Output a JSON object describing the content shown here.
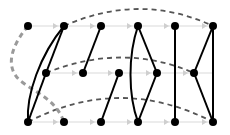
{
  "diagram": {
    "type": "graph",
    "colors": {
      "background": "#ffffff",
      "node": "#000000",
      "solid_edge": "#000000",
      "dashed_edge": "#555555",
      "gray_dashed_edge": "#9a9a9a",
      "guide_line": "#e6e6e6",
      "guide_arrow": "#cfcfcf"
    },
    "rows": [
      {
        "name": "row-top",
        "y": 26,
        "nodes": [
          28,
          64,
          101,
          138,
          175,
          213
        ]
      },
      {
        "name": "row-middle",
        "y": 73,
        "nodes": [
          46,
          83,
          119,
          157,
          194
        ]
      },
      {
        "name": "row-bottom",
        "y": 122,
        "nodes": [
          28,
          64,
          101,
          138,
          175,
          213
        ]
      }
    ],
    "solid_edges": [
      {
        "from": [
          64,
          26
        ],
        "to": [
          28,
          122
        ],
        "curve": true
      },
      {
        "from": [
          64,
          26
        ],
        "to": [
          46,
          73
        ]
      },
      {
        "from": [
          46,
          73
        ],
        "to": [
          28,
          122
        ]
      },
      {
        "from": [
          101,
          26
        ],
        "to": [
          83,
          73
        ]
      },
      {
        "from": [
          119,
          73
        ],
        "to": [
          101,
          122
        ]
      },
      {
        "from": [
          138,
          26
        ],
        "to": [
          138,
          122
        ],
        "curve": true
      },
      {
        "from": [
          138,
          26
        ],
        "to": [
          157,
          73
        ]
      },
      {
        "from": [
          157,
          73
        ],
        "to": [
          138,
          122
        ]
      },
      {
        "from": [
          175,
          26
        ],
        "to": [
          175,
          122
        ]
      },
      {
        "from": [
          213,
          26
        ],
        "to": [
          194,
          73
        ]
      },
      {
        "from": [
          194,
          73
        ],
        "to": [
          213,
          122
        ]
      },
      {
        "from": [
          213,
          26
        ],
        "to": [
          213,
          122
        ]
      }
    ],
    "dashed_edges": [
      {
        "from": [
          64,
          26
        ],
        "to": [
          213,
          26
        ],
        "style": "dark"
      },
      {
        "from": [
          46,
          73
        ],
        "to": [
          194,
          73
        ],
        "style": "dark"
      },
      {
        "from": [
          28,
          122
        ],
        "to": [
          213,
          122
        ],
        "style": "dark"
      },
      {
        "from": [
          28,
          26
        ],
        "to": [
          64,
          122
        ],
        "style": "gray"
      }
    ]
  }
}
